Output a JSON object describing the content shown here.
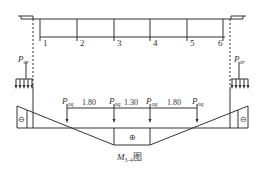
{
  "diagram": {
    "girder_labels": [
      "1",
      "2",
      "3",
      "4",
      "5",
      "6"
    ],
    "load_left": {
      "symbol": "P",
      "subscript": "or"
    },
    "load_right": {
      "symbol": "P",
      "subscript": "or"
    },
    "point_loads": [
      {
        "symbol": "P",
        "subscript": "oq"
      },
      {
        "symbol": "P",
        "subscript": "oq"
      },
      {
        "symbol": "P",
        "subscript": "oq"
      },
      {
        "symbol": "P",
        "subscript": "oq"
      }
    ],
    "spacings": [
      "1.80",
      "1.30",
      "1.80"
    ],
    "sign_left": "⊖",
    "sign_right": "⊖",
    "sign_center": "⊕",
    "caption": {
      "symbol": "M",
      "subscript": "3–4",
      "suffix": "图"
    },
    "line_color": "#333333"
  }
}
